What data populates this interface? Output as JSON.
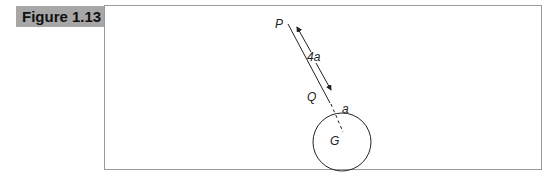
{
  "figure": {
    "label": "Figure 1.13"
  },
  "diagram": {
    "points": {
      "P": "P",
      "Q": "Q",
      "G": "G"
    },
    "labels": {
      "distance": "4a",
      "radius": "a"
    },
    "colors": {
      "label_bg": "#a7a7a7",
      "frame": "#9a9a9a",
      "ink": "#222222"
    }
  }
}
